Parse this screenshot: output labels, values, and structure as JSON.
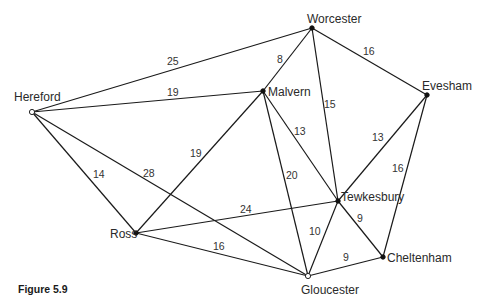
{
  "caption": "Figure 5.9",
  "graph": {
    "nodes": [
      {
        "id": "hereford",
        "label": "Hereford",
        "x": 32,
        "y": 112,
        "style": "open",
        "lx": 14,
        "ly": 101
      },
      {
        "id": "worcester",
        "label": "Worcester",
        "x": 312,
        "y": 28,
        "style": "filled",
        "lx": 307,
        "ly": 23
      },
      {
        "id": "malvern",
        "label": "Malvern",
        "x": 263,
        "y": 91,
        "style": "filled",
        "lx": 268,
        "ly": 96
      },
      {
        "id": "evesham",
        "label": "Evesham",
        "x": 427,
        "y": 95,
        "style": "filled",
        "lx": 422,
        "ly": 90
      },
      {
        "id": "tewkesbury",
        "label": "Tewkesbury",
        "x": 338,
        "y": 201,
        "style": "filled",
        "lx": 341,
        "ly": 201
      },
      {
        "id": "cheltenham",
        "label": "Cheltenham",
        "x": 383,
        "y": 257,
        "style": "filled",
        "lx": 387,
        "ly": 262
      },
      {
        "id": "gloucester",
        "label": "Gloucester",
        "x": 308,
        "y": 276,
        "style": "open",
        "lx": 301,
        "ly": 294
      },
      {
        "id": "ross",
        "label": "Ross",
        "x": 136,
        "y": 233,
        "style": "filled",
        "lx": 110,
        "ly": 238
      }
    ],
    "edges": [
      {
        "from": "hereford",
        "to": "worcester",
        "weight": "25",
        "lx": 167,
        "ly": 65
      },
      {
        "from": "hereford",
        "to": "malvern",
        "weight": "19",
        "lx": 167,
        "ly": 96
      },
      {
        "from": "hereford",
        "to": "ross",
        "weight": "14",
        "lx": 93,
        "ly": 178
      },
      {
        "from": "hereford",
        "to": "gloucester",
        "weight": "28",
        "lx": 143,
        "ly": 177
      },
      {
        "from": "worcester",
        "to": "malvern",
        "weight": "8",
        "lx": 277,
        "ly": 63
      },
      {
        "from": "worcester",
        "to": "tewkesbury",
        "weight": "15",
        "lx": 324,
        "ly": 108
      },
      {
        "from": "worcester",
        "to": "evesham",
        "weight": "16",
        "lx": 363,
        "ly": 55
      },
      {
        "from": "malvern",
        "to": "ross",
        "weight": "19",
        "lx": 190,
        "ly": 157
      },
      {
        "from": "malvern",
        "to": "tewkesbury",
        "weight": "13",
        "lx": 294,
        "ly": 135
      },
      {
        "from": "malvern",
        "to": "gloucester",
        "weight": "20",
        "lx": 286,
        "ly": 179
      },
      {
        "from": "evesham",
        "to": "tewkesbury",
        "weight": "13",
        "lx": 372,
        "ly": 141
      },
      {
        "from": "evesham",
        "to": "cheltenham",
        "weight": "16",
        "lx": 392,
        "ly": 172
      },
      {
        "from": "ross",
        "to": "tewkesbury",
        "weight": "24",
        "lx": 240,
        "ly": 213
      },
      {
        "from": "ross",
        "to": "gloucester",
        "weight": "16",
        "lx": 213,
        "ly": 250
      },
      {
        "from": "tewkesbury",
        "to": "gloucester",
        "weight": "10",
        "lx": 309,
        "ly": 235
      },
      {
        "from": "tewkesbury",
        "to": "cheltenham",
        "weight": "9",
        "lx": 357,
        "ly": 222
      },
      {
        "from": "gloucester",
        "to": "cheltenham",
        "weight": "9",
        "lx": 343,
        "ly": 261
      }
    ]
  }
}
